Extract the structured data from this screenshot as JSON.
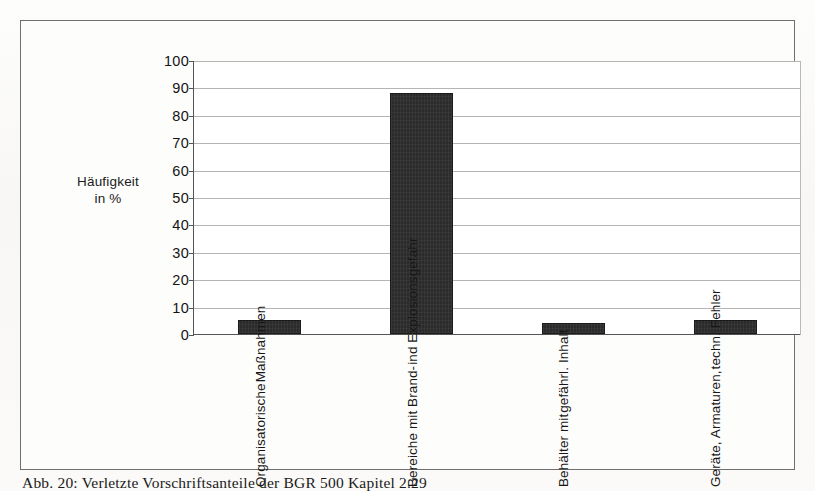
{
  "figure": {
    "caption": "Abb. 20:  Verletzte Vorschriftsanteile der BGR 500 Kapitel 2.29"
  },
  "chart_data": {
    "type": "bar",
    "title": "",
    "xlabel": "",
    "ylabel": "Häufigkeit\nin %",
    "ylabel_line1": "Häufigkeit",
    "ylabel_line2": "in %",
    "ylim": [
      0,
      100
    ],
    "ytick_values": [
      0,
      10,
      20,
      30,
      40,
      50,
      60,
      70,
      80,
      90,
      100
    ],
    "ytick_labels": [
      "0",
      "10",
      "20",
      "30",
      "40",
      "50",
      "60",
      "70",
      "80",
      "90",
      "100"
    ],
    "grid": true,
    "legend": "none",
    "bar_color": "#2b2b2b",
    "categories": [
      "Organisatorische Maßnahmen",
      "Bereiche mit Brand- ind Explosionsgefahr",
      "Behälter mit gefährl. Inhalt",
      "Geräte, Armaturen, techn. Fehler"
    ],
    "category_lines": [
      [
        "Organisatorische",
        "Maßnahmen"
      ],
      [
        "Bereiche mit Brand-",
        "ind Explosionsgefahr"
      ],
      [
        "Behälter mit",
        "gefährl. Inhalt"
      ],
      [
        "Geräte, Armaturen,",
        "techn. Fehler"
      ]
    ],
    "values": [
      5,
      88,
      4,
      5
    ]
  }
}
